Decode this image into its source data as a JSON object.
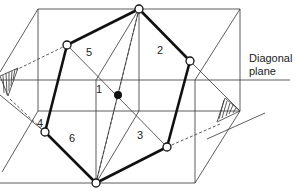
{
  "diagram": {
    "face_labels": [
      "1",
      "2",
      "3",
      "4",
      "5",
      "6"
    ],
    "caption_line1": "Diagonal",
    "caption_line2": "plane",
    "colors": {
      "line": "#333333",
      "outline": "#111111",
      "background": "#ffffff"
    }
  }
}
